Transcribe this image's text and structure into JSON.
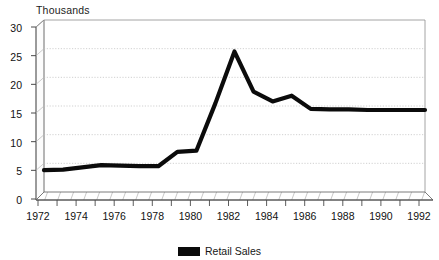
{
  "chart_data": {
    "type": "line",
    "title": "Thousands",
    "xlabel": "",
    "ylabel": "Thousands",
    "ylim": [
      0,
      30
    ],
    "xlim": [
      1972,
      1992
    ],
    "yticks": [
      0,
      5,
      10,
      15,
      20,
      25,
      30
    ],
    "xticks": [
      1972,
      1974,
      1976,
      1978,
      1980,
      1982,
      1984,
      1986,
      1988,
      1990,
      1992
    ],
    "grid": true,
    "legend_position": "bottom",
    "style": "3d-perspective",
    "x": [
      1972,
      1973,
      1974,
      1975,
      1976,
      1977,
      1978,
      1979,
      1980,
      1981,
      1982,
      1983,
      1984,
      1985,
      1986,
      1987,
      1988,
      1989,
      1990,
      1991,
      1992
    ],
    "series": [
      {
        "name": "Retail Sales",
        "color": "#0b0b0b",
        "values": [
          3.8,
          3.9,
          4.3,
          4.7,
          4.6,
          4.5,
          4.5,
          7.0,
          7.2,
          15.5,
          24.5,
          17.5,
          15.8,
          16.8,
          14.5,
          14.4,
          14.4,
          14.3,
          14.3,
          14.3,
          14.3
        ]
      }
    ],
    "legend": [
      {
        "label": "Retail Sales",
        "color": "#0b0b0b"
      }
    ]
  },
  "axis": {
    "y_tick_labels": [
      "30",
      "25",
      "20",
      "15",
      "10",
      "5",
      "0"
    ],
    "x_tick_labels": [
      "1972",
      "1974",
      "1976",
      "1978",
      "1980",
      "1982",
      "1984",
      "1986",
      "1988",
      "1990",
      "1992"
    ],
    "title": "Thousands"
  },
  "colors": {
    "series": "#0b0b0b",
    "grid": "#b9b9b9",
    "axis": "#6e6e6e",
    "wall": "#ffffff",
    "floor_hatch": "#8a8a8a",
    "background": "#ffffff"
  }
}
